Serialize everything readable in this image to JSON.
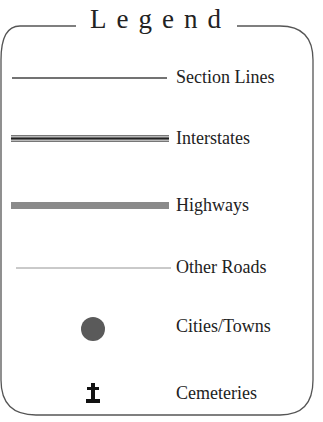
{
  "legend": {
    "title": "Legend",
    "items": [
      {
        "label": "Section Lines",
        "symbol": "thin-line"
      },
      {
        "label": "Interstates",
        "symbol": "double-line"
      },
      {
        "label": "Highways",
        "symbol": "thick-gray-line"
      },
      {
        "label": "Other Roads",
        "symbol": "hairline"
      },
      {
        "label": "Cities/Towns",
        "symbol": "filled-circle"
      },
      {
        "label": "Cemeteries",
        "symbol": "cross-icon"
      }
    ]
  },
  "colors": {
    "text": "#222222",
    "border": "#555555",
    "highway": "#8a8a8a",
    "city": "#5a5a5a"
  }
}
